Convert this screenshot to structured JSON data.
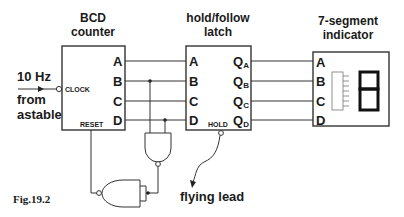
{
  "figure": {
    "caption": "Fig.19.2",
    "input_label": {
      "frequency": "10 Hz",
      "line1": "from",
      "line2": "astable"
    },
    "counter": {
      "title_line1": "BCD",
      "title_line2": "counter",
      "outputs": [
        "A",
        "B",
        "C",
        "D"
      ],
      "clock_label": "CLOCK",
      "reset_label": "RESET"
    },
    "latch": {
      "title_line1": "hold/follow",
      "title_line2": "latch",
      "inputs": [
        "A",
        "B",
        "C",
        "D"
      ],
      "outputs": [
        {
          "base": "Q",
          "sub": "A"
        },
        {
          "base": "Q",
          "sub": "B"
        },
        {
          "base": "Q",
          "sub": "C"
        },
        {
          "base": "Q",
          "sub": "D"
        }
      ],
      "hold_label": "HOLD"
    },
    "indicator": {
      "title_line1": "7-segment",
      "title_line2": "indicator",
      "inputs": [
        "A",
        "B",
        "C",
        "D"
      ],
      "digit": "8"
    },
    "flying_lead_label": "flying lead",
    "gates": [
      {
        "type": "NAND",
        "inputs": [
          "B",
          "D"
        ],
        "name": "decode-nand"
      },
      {
        "type": "NAND",
        "inputs": [
          "tied"
        ],
        "name": "inverter-nand"
      }
    ]
  }
}
